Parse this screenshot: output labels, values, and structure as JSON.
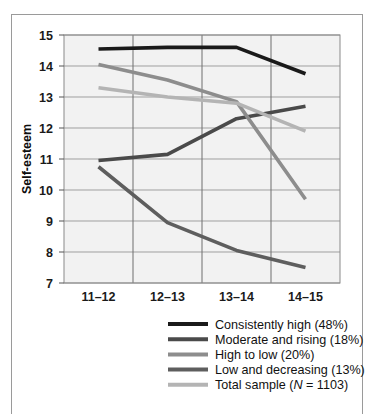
{
  "chart_data": {
    "type": "line",
    "title": "",
    "xlabel": "",
    "ylabel": "Self-esteem",
    "categories": [
      "11–12",
      "12–13",
      "13–14",
      "14–15"
    ],
    "ylim": [
      7,
      15
    ],
    "yticks": [
      "7",
      "8",
      "9",
      "10",
      "11",
      "12",
      "13",
      "14",
      "15"
    ],
    "grid": true,
    "legend_position": "bottom",
    "series": [
      {
        "name": "Consistently high (48%)",
        "color": "#1a1a1a",
        "values": [
          14.55,
          14.6,
          14.6,
          13.75
        ]
      },
      {
        "name": "Moderate and rising (18%)",
        "color": "#4a4a4a",
        "values": [
          10.95,
          11.15,
          12.3,
          12.7
        ]
      },
      {
        "name": "High to low (20%)",
        "color": "#8d8d8d",
        "values": [
          14.05,
          13.55,
          12.85,
          9.7
        ]
      },
      {
        "name": "Low and decreasing (13%)",
        "color": "#5e5e5e",
        "values": [
          10.75,
          8.95,
          8.05,
          7.5
        ]
      },
      {
        "name": "Total sample (N = 1103)",
        "color": "#b4b4b4",
        "values": [
          13.3,
          13.0,
          12.8,
          11.9
        ]
      }
    ],
    "legend": [
      {
        "label": "Consistently high (48%)",
        "color": "#1a1a1a"
      },
      {
        "label": "Moderate and rising (18%)",
        "color": "#4a4a4a"
      },
      {
        "label": "High to low (20%)",
        "color": "#8d8d8d"
      },
      {
        "label": "Low and decreasing (13%)",
        "color": "#5e5e5e"
      },
      {
        "label": "Total sample (N = 1103)",
        "color": "#b4b4b4"
      }
    ],
    "legend_total_sample": {
      "prefix": "Total sample (",
      "italic": "N",
      "suffix": " = 1103)"
    },
    "colors": {
      "plot_background": "#f2f2f2",
      "gridline": "#9f9f9f",
      "axis": "#6e6e6e",
      "text": "#111111"
    }
  }
}
